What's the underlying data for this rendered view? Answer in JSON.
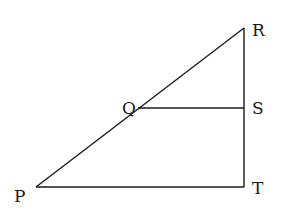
{
  "diagram": {
    "points": {
      "P": {
        "label": "P",
        "x": 36,
        "y": 187,
        "lx": 14,
        "ly": 202
      },
      "Q": {
        "label": "Q",
        "x": 138,
        "y": 108,
        "lx": 122,
        "ly": 114
      },
      "R": {
        "label": "R",
        "x": 244,
        "y": 28,
        "lx": 252,
        "ly": 36
      },
      "S": {
        "label": "S",
        "x": 244,
        "y": 108,
        "lx": 252,
        "ly": 114
      },
      "T": {
        "label": "T",
        "x": 244,
        "y": 187,
        "lx": 252,
        "ly": 194
      }
    },
    "segments": [
      {
        "from": "P",
        "to": "R"
      },
      {
        "from": "R",
        "to": "T"
      },
      {
        "from": "P",
        "to": "T"
      },
      {
        "from": "Q",
        "to": "S"
      }
    ],
    "stroke_color": "#1a1a1a"
  }
}
